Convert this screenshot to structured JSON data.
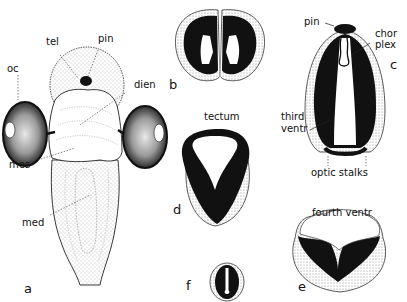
{
  "figure": {
    "panels": [
      {
        "id": "a",
        "letter": "a",
        "description": "Dorsal view of embryonic brain with optic cups"
      },
      {
        "id": "b",
        "letter": "b",
        "description": "Cross section through telencephalon"
      },
      {
        "id": "c",
        "letter": "c",
        "description": "Cross section through diencephalon"
      },
      {
        "id": "d",
        "letter": "d",
        "description": "Cross section through mesencephalon"
      },
      {
        "id": "e",
        "letter": "e",
        "description": "Cross section through medulla"
      },
      {
        "id": "f",
        "letter": "f",
        "description": "Cross section through spinal cord"
      }
    ],
    "labels": {
      "oc": "oc",
      "tel": "tel",
      "pin_a": "pin",
      "dien": "dien",
      "mes": "mes",
      "med": "med",
      "pin_c": "pin",
      "chor": "chor",
      "plex": "plex",
      "third": "third",
      "ventr": "ventr",
      "optic_stalks": "optic stalks",
      "tectum": "tectum",
      "fourth_ventr": "fourth ventr"
    },
    "colors": {
      "ink": "#111111",
      "stipple": "#d8d8d8",
      "background": "#ffffff"
    }
  }
}
